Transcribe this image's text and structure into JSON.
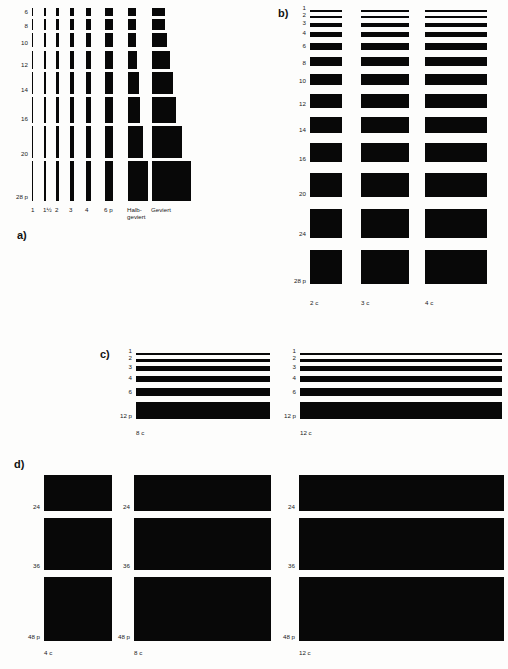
{
  "page": {
    "background_color": "#fdfdfc",
    "ink_color": "#080808"
  },
  "sections": [
    {
      "key": "a",
      "label": "a)",
      "description": "Ausschluss / Spatien – Breiten in Punkt gegen Kegelhöhe",
      "row_labels": [
        "6",
        "8",
        "10",
        "12",
        "14",
        "16",
        "20",
        "28 p"
      ],
      "col_labels": [
        "1",
        "1½",
        "2",
        "3",
        "4",
        "6 p",
        "Halb-\ngeviert",
        "Geviert"
      ],
      "col_labels_flat": [
        "1",
        "1½",
        "2",
        "3",
        "4",
        "6 p",
        "Halb-",
        "Geviert"
      ],
      "col_label_second_line": "geviert",
      "rows": [
        {
          "label": "6",
          "height": 8,
          "widths": [
            1.3,
            2.0,
            2.6,
            4.0,
            5.3,
            8.0,
            8.0,
            12.5
          ]
        },
        {
          "label": "8",
          "height": 11,
          "widths": [
            1.3,
            2.0,
            2.6,
            4.0,
            5.3,
            8.0,
            8.0,
            12.5
          ]
        },
        {
          "label": "10",
          "height": 14,
          "widths": [
            1.3,
            2.0,
            2.6,
            4.0,
            5.3,
            8.0,
            8.0,
            14.5
          ]
        },
        {
          "label": "12",
          "height": 18,
          "widths": [
            1.3,
            2.0,
            2.6,
            4.0,
            5.3,
            8.0,
            9.0,
            17.5
          ]
        },
        {
          "label": "14",
          "height": 22,
          "widths": [
            1.3,
            2.0,
            2.6,
            4.0,
            5.3,
            8.0,
            10.5,
            20.5
          ]
        },
        {
          "label": "16",
          "height": 26,
          "widths": [
            1.3,
            2.0,
            2.6,
            4.0,
            5.3,
            8.0,
            12.0,
            24.0
          ]
        },
        {
          "label": "20",
          "height": 32,
          "widths": [
            1.3,
            2.0,
            2.6,
            4.0,
            5.3,
            8.0,
            15.0,
            30.0
          ]
        },
        {
          "label": "28 p",
          "height": 40,
          "widths": [
            1.3,
            2.0,
            2.6,
            4.0,
            5.3,
            8.0,
            19.5,
            39.0
          ]
        }
      ]
    },
    {
      "key": "b",
      "label": "b)",
      "description": "Messinglinien / Blindmaterial – Stärken in Punkt, Längen 2c, 3c, 4c",
      "row_labels": [
        "1",
        "2",
        "3",
        "4",
        "6",
        "8",
        "10",
        "12",
        "14",
        "16",
        "20",
        "24",
        "28 p"
      ],
      "col_labels": [
        "2 c",
        "3 c",
        "4 c"
      ],
      "col_widths": [
        32,
        48,
        62
      ],
      "row_thicknesses": [
        1.5,
        2.5,
        3.5,
        4.5,
        6.5,
        9,
        11,
        14,
        16,
        19,
        24,
        29,
        34
      ]
    },
    {
      "key": "c",
      "label": "c)",
      "description": "Lange Linien – Stärken in Punkt, Längen 8c und 12c",
      "row_labels": [
        "1",
        "2",
        "3",
        "4",
        "6",
        "12 p"
      ],
      "col_labels": [
        "8 c",
        "12 c"
      ],
      "col_widths": [
        134,
        202
      ],
      "row_thicknesses": [
        1.5,
        3,
        4.5,
        6,
        8,
        17
      ]
    },
    {
      "key": "d",
      "label": "d)",
      "description": "Große Blindmaterial-Stege – Kegel 24, 36, 48 Punkt, Breiten 4c, 8c, 12c",
      "row_labels": [
        "24",
        "36",
        "48 p"
      ],
      "col_labels": [
        "4 c",
        "8 c",
        "12 c"
      ],
      "col_widths": [
        68,
        137,
        205
      ],
      "row_heights": [
        36,
        52,
        64
      ]
    }
  ]
}
